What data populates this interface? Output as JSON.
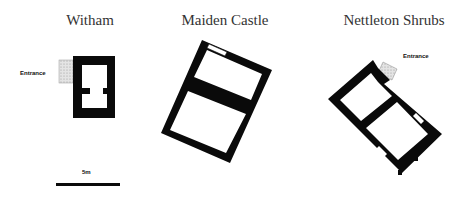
{
  "plans": [
    {
      "title": "Witham",
      "entrance_label": "Entrance"
    },
    {
      "title": "Maiden Castle"
    },
    {
      "title": "Nettleton Shrubs",
      "entrance_label": "Entrance"
    }
  ],
  "scale_bar": {
    "label": "5m"
  },
  "colors": {
    "wall": "#0a0a0a",
    "entrance_fill": "#d6d6d6",
    "title": "#333333"
  }
}
